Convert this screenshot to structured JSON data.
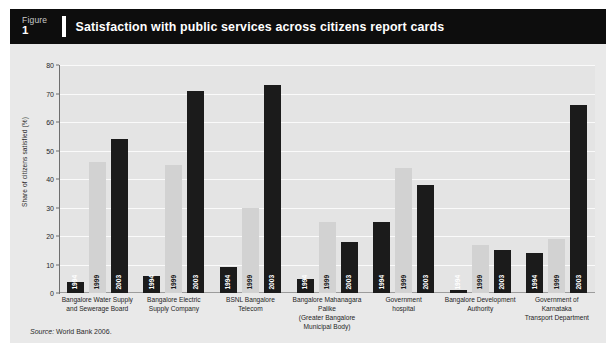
{
  "figure": {
    "label_word": "Figure",
    "number": "1",
    "title": "Satisfaction with public services across citizens report cards"
  },
  "source": {
    "prefix": "Source:",
    "text": "World Bank 2006."
  },
  "chart_data": {
    "type": "bar",
    "title": "Satisfaction with public services across citizens report cards",
    "xlabel": "",
    "ylabel": "Share of citizens satisfied (%)",
    "ylim": [
      0,
      80
    ],
    "yticks": [
      0,
      10,
      20,
      30,
      40,
      50,
      60,
      70,
      80
    ],
    "grid": true,
    "legend": "none",
    "categories": [
      "Bangalore Water Supply and Sewerage Board",
      "Bangalore Electric Supply Company",
      "BSNL Bangalore Telecom",
      "Bangalore Mahanagara Palike (Greater Bangalore Municipal Body)",
      "Government hospital",
      "Bangalore Development Authority",
      "Government of Karnataka Transport Department"
    ],
    "category_lines": [
      [
        "Bangalore Water Supply",
        "and Sewerage Board"
      ],
      [
        "Bangalore Electric",
        "Supply Company"
      ],
      [
        "BSNL Bangalore",
        "Telecom"
      ],
      [
        "Bangalore Mahanagara Palike",
        "(Greater Bangalore Municipal Body)"
      ],
      [
        "Government",
        "hospital"
      ],
      [
        "Bangalore Development",
        "Authority"
      ],
      [
        "Government of Karnataka",
        "Transport Department"
      ]
    ],
    "series": [
      {
        "name": "1994",
        "color": "#1b1b1b",
        "values": [
          4,
          6,
          9,
          5,
          25,
          1,
          14
        ]
      },
      {
        "name": "1999",
        "color": "#d2d2d2",
        "values": [
          46,
          45,
          30,
          25,
          44,
          17,
          19
        ]
      },
      {
        "name": "2003",
        "color": "#1b1b1b",
        "values": [
          54,
          71,
          73,
          18,
          38,
          15,
          66
        ]
      }
    ]
  },
  "colors": {
    "header_bg": "#0d0d0d",
    "panel_bg": "#e9e9e9",
    "plot_bg": "#e4e4e4",
    "gridline": "#fafafa",
    "bar_dark": "#1b1b1b",
    "bar_light": "#d2d2d2"
  }
}
